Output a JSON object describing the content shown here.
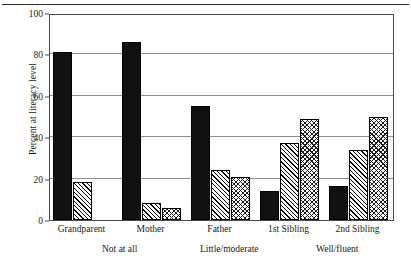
{
  "figure": {
    "top_rule": "horizontal-rule"
  },
  "chart_data": {
    "type": "bar",
    "title": "",
    "xlabel": "",
    "ylabel": "Percent at literacy level",
    "ylim": [
      0,
      100
    ],
    "yticks": [
      0,
      20,
      40,
      60,
      80,
      100
    ],
    "ytick_labels": [
      "0",
      "20",
      "40",
      "60",
      "80",
      "100"
    ],
    "grid": true,
    "grid_axis": "y",
    "legend_position": "bottom",
    "categories": [
      "Grandparent",
      "Mother",
      "Father",
      "1st Sibling",
      "2nd Sibling"
    ],
    "series": [
      {
        "name": "Not at all",
        "pattern": "solid",
        "color": "#111111",
        "values": [
          81,
          86,
          55,
          14,
          16.5
        ]
      },
      {
        "name": "Little/moderate",
        "pattern": "diagonal-hatch",
        "color": "#000000",
        "values": [
          18.5,
          8,
          24,
          37,
          34
        ]
      },
      {
        "name": "Well/fluent",
        "pattern": "cross-hatch",
        "color": "#1c1c1c",
        "values": [
          0,
          6,
          21,
          49,
          50
        ]
      }
    ]
  }
}
